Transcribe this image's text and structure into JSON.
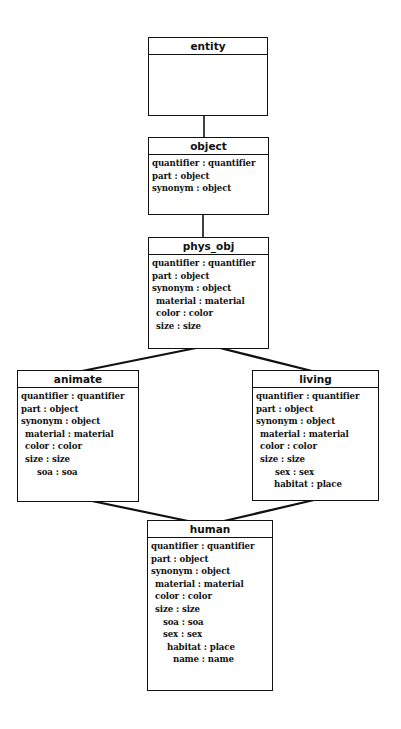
{
  "diagram": {
    "type": "type-hierarchy",
    "nodes": [
      {
        "id": "entity",
        "title": "entity",
        "attrs": []
      },
      {
        "id": "object",
        "title": "object",
        "attrs": [
          {
            "text": "quantifier : quantifier",
            "indent": 0
          },
          {
            "text": "part : object",
            "indent": 0
          },
          {
            "text": "synonym : object",
            "indent": 0
          }
        ]
      },
      {
        "id": "phys_obj",
        "title": "phys_obj",
        "attrs": [
          {
            "text": "quantifier : quantifier",
            "indent": 0
          },
          {
            "text": "part : object",
            "indent": 0
          },
          {
            "text": "synonym : object",
            "indent": 0
          },
          {
            "text": "material : material",
            "indent": 1
          },
          {
            "text": "color : color",
            "indent": 1
          },
          {
            "text": "size : size",
            "indent": 1
          }
        ]
      },
      {
        "id": "animate",
        "title": "animate",
        "attrs": [
          {
            "text": "quantifier : quantifier",
            "indent": 0
          },
          {
            "text": "part : object",
            "indent": 0
          },
          {
            "text": "synonym : object",
            "indent": 0
          },
          {
            "text": "material : material",
            "indent": 1
          },
          {
            "text": "color : color",
            "indent": 1
          },
          {
            "text": "size : size",
            "indent": 1
          },
          {
            "text": "soa : soa",
            "indent": 3
          }
        ]
      },
      {
        "id": "living",
        "title": "living",
        "attrs": [
          {
            "text": "quantifier : quantifier",
            "indent": 0
          },
          {
            "text": "part : object",
            "indent": 0
          },
          {
            "text": "synonym : object",
            "indent": 0
          },
          {
            "text": "material : material",
            "indent": 1
          },
          {
            "text": "color : color",
            "indent": 1
          },
          {
            "text": "size : size",
            "indent": 1
          },
          {
            "text": "sex : sex",
            "indent": 4
          },
          {
            "text": "habitat : place",
            "indent": 4
          }
        ]
      },
      {
        "id": "human",
        "title": "human",
        "attrs": [
          {
            "text": "quantifier : quantifier",
            "indent": 0
          },
          {
            "text": "part : object",
            "indent": 0
          },
          {
            "text": "synonym : object",
            "indent": 0
          },
          {
            "text": "material : material",
            "indent": 1
          },
          {
            "text": "color : color",
            "indent": 1
          },
          {
            "text": "size : size",
            "indent": 1
          },
          {
            "text": "soa : soa",
            "indent": 3
          },
          {
            "text": "sex : sex",
            "indent": 3
          },
          {
            "text": "habitat : place",
            "indent": 4
          },
          {
            "text": "name : name",
            "indent": 5
          }
        ]
      }
    ],
    "edges": [
      {
        "from": "entity",
        "to": "object"
      },
      {
        "from": "object",
        "to": "phys_obj"
      },
      {
        "from": "phys_obj",
        "to": "animate"
      },
      {
        "from": "phys_obj",
        "to": "living"
      },
      {
        "from": "animate",
        "to": "human"
      },
      {
        "from": "living",
        "to": "human"
      }
    ]
  }
}
